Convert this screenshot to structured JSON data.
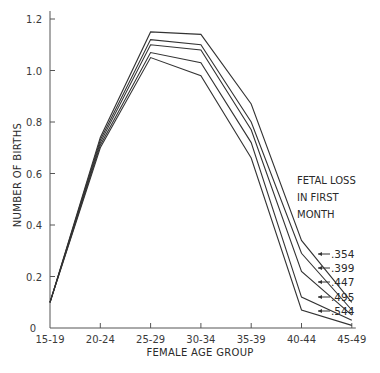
{
  "chart_data": {
    "type": "line",
    "title": "",
    "xlabel": "FEMALE AGE GROUP",
    "ylabel": "NUMBER OF BIRTHS",
    "categories": [
      "15-19",
      "20-24",
      "25-29",
      "30-34",
      "35-39",
      "40-44",
      "45-49"
    ],
    "yticks": [
      "0",
      "0.2",
      "0.4",
      "0.6",
      "0.8",
      "1.0",
      "1.2"
    ],
    "ylim": [
      0,
      1.2
    ],
    "grid": false,
    "legend_title": [
      "FETAL LOSS",
      "IN FIRST",
      "MONTH"
    ],
    "series": [
      {
        "name": ".354",
        "values": [
          0.1,
          0.74,
          1.15,
          1.14,
          0.87,
          0.34,
          0.1
        ]
      },
      {
        "name": ".399",
        "values": [
          0.1,
          0.73,
          1.12,
          1.1,
          0.8,
          0.29,
          0.07
        ]
      },
      {
        "name": ".447",
        "values": [
          0.1,
          0.72,
          1.1,
          1.08,
          0.77,
          0.22,
          0.05
        ]
      },
      {
        "name": ".495",
        "values": [
          0.1,
          0.71,
          1.07,
          1.03,
          0.72,
          0.12,
          0.03
        ]
      },
      {
        "name": ".544",
        "values": [
          0.1,
          0.7,
          1.05,
          0.98,
          0.66,
          0.07,
          0.01
        ]
      }
    ]
  }
}
